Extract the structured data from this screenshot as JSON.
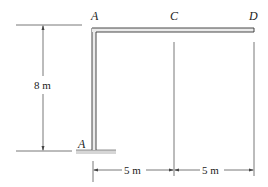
{
  "diagram": {
    "type": "structural-frame",
    "points": [
      {
        "id": "A",
        "label": "A",
        "description": "fixed support at base of column"
      },
      {
        "id": "B",
        "label": "B",
        "description": "top-left corner joint"
      },
      {
        "id": "C",
        "label": "C",
        "description": "midpoint of beam"
      },
      {
        "id": "D",
        "label": "D",
        "description": "free end of beam"
      }
    ],
    "dimensions": {
      "height": "8 m",
      "span_bc": "5 m",
      "span_cd": "5 m"
    },
    "colors": {
      "line": "#333333",
      "member_fill": "#e6e6e6",
      "ground": "#cfcfcf"
    }
  }
}
